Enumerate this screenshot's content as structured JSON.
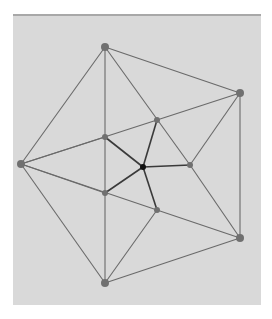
{
  "diagram": {
    "type": "graph",
    "colors": {
      "panel": "#d9d9d9",
      "edge_outer": "#6a6a6a",
      "edge_inner": "#3a3a3a",
      "node": "#707070",
      "hub": "#111111"
    },
    "nodes": [
      {
        "id": "A",
        "x": 105,
        "y": 47,
        "r": 4
      },
      {
        "id": "B",
        "x": 240,
        "y": 93,
        "r": 4
      },
      {
        "id": "C",
        "x": 21,
        "y": 164,
        "r": 4
      },
      {
        "id": "D",
        "x": 240,
        "y": 238,
        "r": 4
      },
      {
        "id": "E",
        "x": 105,
        "y": 283,
        "r": 4
      },
      {
        "id": "F",
        "x": 105,
        "y": 137,
        "r": 3
      },
      {
        "id": "G",
        "x": 157,
        "y": 120,
        "r": 3
      },
      {
        "id": "H",
        "x": 190,
        "y": 165,
        "r": 3
      },
      {
        "id": "I",
        "x": 157,
        "y": 210,
        "r": 3
      },
      {
        "id": "J",
        "x": 105,
        "y": 193,
        "r": 3
      },
      {
        "id": "K",
        "x": 143,
        "y": 167,
        "r": 3,
        "hub": true
      }
    ],
    "edges": [
      [
        "A",
        "B"
      ],
      [
        "B",
        "D"
      ],
      [
        "D",
        "E"
      ],
      [
        "E",
        "C"
      ],
      [
        "C",
        "A"
      ],
      [
        "A",
        "F"
      ],
      [
        "A",
        "H"
      ],
      [
        "C",
        "F"
      ],
      [
        "C",
        "J"
      ],
      [
        "B",
        "G"
      ],
      [
        "B",
        "H"
      ],
      [
        "C",
        "G"
      ],
      [
        "D",
        "I"
      ],
      [
        "D",
        "H"
      ],
      [
        "C",
        "I"
      ],
      [
        "E",
        "J"
      ],
      [
        "E",
        "I"
      ],
      [
        "F",
        "J"
      ],
      [
        "K",
        "F"
      ],
      [
        "K",
        "G"
      ],
      [
        "K",
        "H"
      ],
      [
        "K",
        "I"
      ],
      [
        "K",
        "J"
      ]
    ]
  }
}
